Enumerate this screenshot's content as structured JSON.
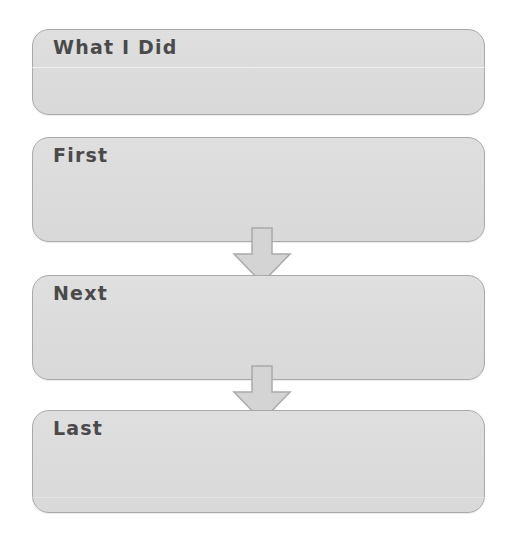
{
  "document": {
    "type": "sequence-graphic-organizer",
    "title": "What I Did",
    "background_color": "#ffffff",
    "box_fill_color": "#dcdcdc",
    "box_border_color": "#a9a9a9",
    "text_color": "#4a4a4a",
    "arrow_fill_color": "#d4d4d4",
    "arrow_border_color": "#a9a9a9"
  },
  "boxes": [
    {
      "id": "what-i-did",
      "label": "What I Did",
      "content": ""
    },
    {
      "id": "first",
      "label": "First",
      "content": ""
    },
    {
      "id": "next",
      "label": "Next",
      "content": ""
    },
    {
      "id": "last",
      "label": "Last",
      "content": ""
    }
  ],
  "arrows": [
    {
      "id": "first-to-next",
      "direction": "down",
      "from": "first",
      "to": "next"
    },
    {
      "id": "next-to-last",
      "direction": "down",
      "from": "next",
      "to": "last"
    }
  ]
}
